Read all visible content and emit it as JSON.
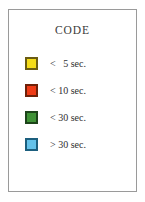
{
  "panel": {
    "title": "CODE",
    "border_color": "#9a9a9a",
    "background_color": "#ffffff"
  },
  "chart_data": {
    "type": "table",
    "title": "CODE",
    "xlabel": "",
    "ylabel": "",
    "categories": [
      "<   5 sec.",
      "< 10 sec.",
      "< 30 sec.",
      "> 30 sec."
    ],
    "values": [
      5,
      10,
      30,
      30
    ],
    "legend_position": "standalone",
    "grid": false,
    "series": [
      {
        "name": "CODE",
        "entries": [
          {
            "label": "<   5 sec.",
            "operator": "<",
            "threshold": 5,
            "unit": "sec.",
            "color": "#f5dc18",
            "border_color": "#6b5c12"
          },
          {
            "label": "< 10 sec.",
            "operator": "<",
            "threshold": 10,
            "unit": "sec.",
            "color": "#ef3b16",
            "border_color": "#6e2109"
          },
          {
            "label": "< 30 sec.",
            "operator": "<",
            "threshold": 30,
            "unit": "sec.",
            "color": "#3f9236",
            "border_color": "#1d441a"
          },
          {
            "label": "> 30 sec.",
            "operator": ">",
            "threshold": 30,
            "unit": "sec.",
            "color": "#64c2ea",
            "border_color": "#1c5f7e"
          }
        ]
      }
    ]
  },
  "legend": {
    "items": [
      {
        "label": "<   5 sec.",
        "swatch_name": "swatch-yellow",
        "color": "#f5dc18",
        "border_color": "#6b5c12"
      },
      {
        "label": "< 10 sec.",
        "swatch_name": "swatch-red",
        "color": "#ef3b16",
        "border_color": "#6e2109"
      },
      {
        "label": "< 30 sec.",
        "swatch_name": "swatch-green",
        "color": "#3f9236",
        "border_color": "#1d441a"
      },
      {
        "label": "> 30 sec.",
        "swatch_name": "swatch-blue",
        "color": "#64c2ea",
        "border_color": "#1c5f7e"
      }
    ]
  }
}
